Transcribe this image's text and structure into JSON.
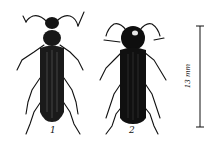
{
  "figure": {
    "specimens": [
      {
        "label": "1",
        "description": "slender beetle, dark elytra with pale streaks"
      },
      {
        "label": "2",
        "description": "broader beetle, dark elytra, pronotum with pale spot"
      }
    ],
    "scale_bar": {
      "label": "13 mm"
    },
    "colors": {
      "ink": "#111111",
      "background": "#ffffff"
    }
  }
}
